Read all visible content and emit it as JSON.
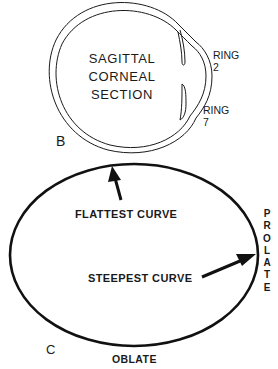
{
  "panel_b": {
    "letter": "B",
    "title_lines": [
      "SAGITTAL",
      "CORNEAL",
      "SECTION"
    ],
    "ring_upper": {
      "line1": "RING",
      "line2": "2"
    },
    "ring_lower": {
      "line1": "RING",
      "line2": "7"
    }
  },
  "panel_c": {
    "letter": "C",
    "flattest_label": "FLATTEST CURVE",
    "steepest_label": "STEEPEST CURVE",
    "prolate_label": "PROLATE",
    "prolate_letters": [
      "P",
      "R",
      "O",
      "L",
      "A",
      "T",
      "E"
    ],
    "oblate_label": "OBLATE"
  },
  "colors": {
    "line": "#1a1a1a",
    "background": "#ffffff"
  }
}
